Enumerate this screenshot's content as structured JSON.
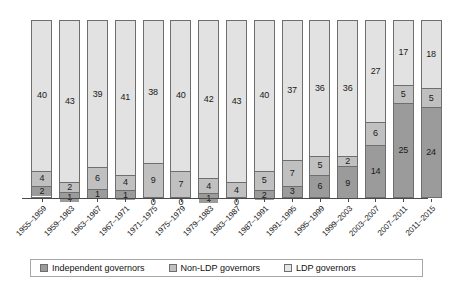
{
  "chart_data": {
    "type": "bar",
    "stacked": true,
    "title": "",
    "subtitle": "",
    "xlabel": "",
    "ylabel": "",
    "grid": false,
    "legend_position": "bottom",
    "ylim": [
      0,
      47
    ],
    "categories": [
      "1955–1959",
      "1959–1963",
      "1963–1967",
      "1967–1971",
      "1971–1975",
      "1975–1979",
      "1979–1983",
      "1983–1987",
      "1987–1991",
      "1991–1995",
      "1995–1999",
      "1999–2003",
      "2003–2007",
      "2007–2011",
      "2011–2015"
    ],
    "series": [
      {
        "name": "Independent governors",
        "color": "#9b9b9b",
        "values": [
          2,
          1,
          1,
          1,
          0,
          0,
          1,
          0,
          2,
          3,
          6,
          9,
          14,
          25,
          24
        ]
      },
      {
        "name": "Non-LDP governors",
        "color": "#c0c0c0",
        "values": [
          4,
          2,
          6,
          4,
          9,
          7,
          4,
          4,
          5,
          7,
          5,
          2,
          6,
          5,
          5
        ]
      },
      {
        "name": "LDP governors",
        "color": "#e2e2e2",
        "values": [
          40,
          43,
          39,
          41,
          38,
          40,
          42,
          43,
          40,
          37,
          36,
          36,
          27,
          17,
          18
        ]
      }
    ],
    "totals": [
      46,
      46,
      46,
      46,
      47,
      47,
      47,
      47,
      47,
      47,
      47,
      47,
      47,
      47,
      47
    ]
  },
  "legend": {
    "items": [
      {
        "label": "Independent governors",
        "swatch": "ind"
      },
      {
        "label": "Non-LDP governors",
        "swatch": "nonldp"
      },
      {
        "label": "LDP governors",
        "swatch": "ldp"
      }
    ]
  },
  "colors": {
    "independent": "#9b9b9b",
    "non_ldp": "#c0c0c0",
    "ldp": "#e2e2e2",
    "axis": "#4a4a4a",
    "outline": "#6e6e6e",
    "text": "#1a1a1a"
  }
}
